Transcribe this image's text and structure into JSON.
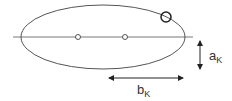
{
  "diagram": {
    "type": "ellipse-orbit",
    "colors": {
      "stroke": "#555555",
      "arrow": "#222222",
      "text": "#333333",
      "background": "#ffffff"
    },
    "ellipse": {
      "cx": 103,
      "cy": 37,
      "rx": 82,
      "ry": 32
    },
    "major_axis_line": {
      "x1": 13,
      "x2": 193,
      "y": 37
    },
    "foci": [
      {
        "cx": 78,
        "cy": 37,
        "r": 2.5
      },
      {
        "cx": 125,
        "cy": 37,
        "r": 2.5
      }
    ],
    "body": {
      "cx": 166,
      "cy": 17,
      "r": 5
    },
    "labels": {
      "a": {
        "main": "a",
        "sub": "K"
      },
      "b": {
        "main": "b",
        "sub": "K"
      }
    },
    "arrows": {
      "a": {
        "x": 200,
        "y1": 40,
        "y2": 70
      },
      "b": {
        "y": 78,
        "x1": 108,
        "x2": 184
      }
    }
  }
}
